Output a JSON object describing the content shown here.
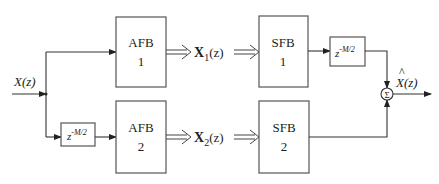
{
  "diagram": {
    "input_label": "X(z)",
    "output_label_hat": "^",
    "output_label": "X(z)",
    "sum_symbol": "Σ",
    "blocks": [
      {
        "id": "afb1",
        "line1": "AFB",
        "line2": "1"
      },
      {
        "id": "afb2",
        "line1": "AFB",
        "line2": "2"
      },
      {
        "id": "sfb1",
        "line1": "SFB",
        "line2": "1"
      },
      {
        "id": "sfb2",
        "line1": "SFB",
        "line2": "2"
      }
    ],
    "delays": [
      {
        "id": "delay-input",
        "base": "z",
        "exp": "-M/2"
      },
      {
        "id": "delay-output",
        "base": "z",
        "exp": "-M/2"
      }
    ],
    "signals": [
      {
        "id": "x1",
        "base": "X",
        "sub": "1",
        "arg": "(z)"
      },
      {
        "id": "x2",
        "base": "X",
        "sub": "2",
        "arg": "(z)"
      }
    ]
  }
}
